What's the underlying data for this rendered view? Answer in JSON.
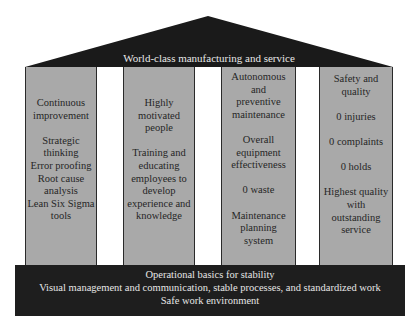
{
  "colors": {
    "roof": "#1a1a1a",
    "pillar": "#a9a9a9",
    "pillar_border": "#2a2a2a",
    "base": "#1e1e1e",
    "light_text": "#e8e8e8",
    "dark_text": "#262626"
  },
  "roof": {
    "title": "World-class manufacturing and service"
  },
  "pillars": [
    {
      "title_lines": [
        "Continuous",
        "improvement"
      ],
      "items": [
        [
          "Strategic",
          "thinking",
          "Error proofing",
          "Root cause",
          "analysis",
          "Lean Six Sigma",
          "tools"
        ]
      ]
    },
    {
      "title_lines": [
        "Highly",
        "motivated",
        "people"
      ],
      "items": [
        [
          "Training and",
          "educating",
          "employees to",
          "develop",
          "experience and",
          "knowledge"
        ]
      ]
    },
    {
      "title_lines": [
        "Autonomous",
        "and",
        "preventive",
        "maintenance"
      ],
      "items": [
        [
          "Overall",
          "equipment",
          "effectiveness"
        ],
        [
          "0 waste"
        ],
        [
          "Maintenance",
          "planning",
          "system"
        ]
      ]
    },
    {
      "title_lines": [
        "Safety and",
        "quality"
      ],
      "items": [
        [
          "0 injuries"
        ],
        [
          "0 complaints"
        ],
        [
          "0 holds"
        ],
        [
          "Highest quality",
          "with",
          "outstanding",
          "service"
        ]
      ]
    }
  ],
  "base": {
    "lines": [
      "Operational basics for stability",
      "Visual management and communication, stable processes, and standardized work",
      "Safe work environment"
    ]
  }
}
